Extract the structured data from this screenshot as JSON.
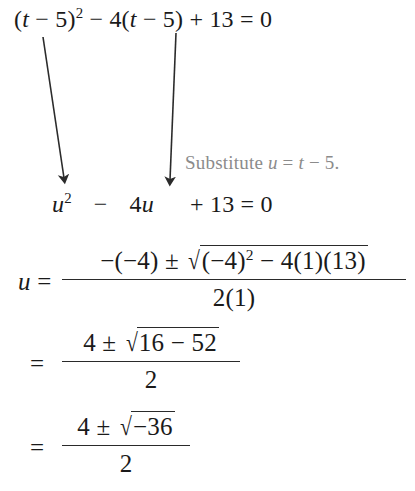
{
  "document": {
    "kind": "worked-example",
    "topic": "solving-by-substitution",
    "background_color": "#ffffff",
    "text_color": "#1a1a1a",
    "note_color": "#8b8b8b"
  },
  "steps": {
    "original_equation": {
      "lhs_open_paren": "(",
      "var_t": "t",
      "minus_1": " − ",
      "five_1": "5",
      "close_paren_1": ")",
      "exponent": "2",
      "minus_2": " − ",
      "four": "4",
      "open_paren_2": "(",
      "var_t2": "t",
      "minus_3": " − ",
      "five_2": "5",
      "close_paren_2": ")",
      "plus": " + ",
      "thirteen": "13",
      "equals": "  =  ",
      "zero": "0",
      "plain": "(t − 5)² − 4(t − 5) + 13 = 0"
    },
    "substitute_note": {
      "label": "Substitute ",
      "var_u": "u",
      "equals": " = ",
      "var_t": "t",
      "minus": " − ",
      "five": "5",
      "period": ".",
      "plain": "Substitute u = t − 5."
    },
    "substituted_equation": {
      "var_u": "u",
      "exponent": "2",
      "minus": "−",
      "four": "4",
      "var_u2": "u",
      "plus": "+",
      "thirteen": "13",
      "equals": "=",
      "zero": "0",
      "plain": "u² − 4u + 13 = 0"
    },
    "quadratic_formula": {
      "lhs_var": "u",
      "lhs_equals": "=",
      "numerator": {
        "neg_open": "−(",
        "neg_four": "−4",
        "neg_close": ")",
        "plus_minus": " ± ",
        "radicand_open": "(",
        "radicand_neg_four": "−4",
        "radicand_close": ")",
        "radicand_exponent": "2",
        "radicand_minus": " − ",
        "radicand_four": "4",
        "radicand_one": "(1)",
        "radicand_thirteen": "(13)",
        "plain": "−(−4) ± √((−4)² − 4(1)(13))"
      },
      "denominator": "2(1)"
    },
    "simplify_step_1": {
      "equals": "=",
      "numerator": {
        "four": "4",
        "plus_minus": " ± ",
        "radicand_a": "16",
        "radicand_minus": " − ",
        "radicand_b": "52",
        "plain": "4 ± √(16 − 52)"
      },
      "denominator": "2"
    },
    "simplify_step_2": {
      "equals": "=",
      "numerator": {
        "four": "4",
        "plus_minus": " ± ",
        "radicand": "−36",
        "plain": "4 ± √(−36)"
      },
      "denominator": "2"
    }
  },
  "annotations": {
    "arrow_left": {
      "name": "substitution-arrow-left",
      "from_x": 43,
      "from_y": 37,
      "to_x": 64,
      "to_y": 184
    },
    "arrow_right": {
      "name": "substitution-arrow-right",
      "from_x": 176,
      "from_y": 33,
      "to_x": 170,
      "to_y": 186
    },
    "arrow_color": "#2b2b2b"
  },
  "radical_glyph": "√"
}
